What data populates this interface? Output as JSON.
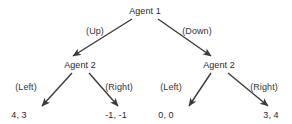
{
  "diagram": {
    "type": "extensive-form-game-tree",
    "background_color": "#ffffff",
    "line_color": "#3a3a3a",
    "text_color": "#2b2b2b",
    "nodes": [
      {
        "id": "root",
        "label": "Agent 1",
        "x": 145,
        "y": 11
      },
      {
        "id": "left-node",
        "label": "Agent 2",
        "x": 80,
        "y": 66
      },
      {
        "id": "right-node",
        "label": "Agent 2",
        "x": 219,
        "y": 66
      }
    ],
    "edges": [
      {
        "id": "root-up",
        "label": "(Up)",
        "from": "root",
        "to": "left-node",
        "label_x": 95,
        "label_y": 31
      },
      {
        "id": "root-down",
        "label": "(Down)",
        "from": "root",
        "to": "right-node",
        "label_x": 197,
        "label_y": 31
      },
      {
        "id": "left-left",
        "label": "(Left)",
        "from": "left-node",
        "to": "payoff-1",
        "label_x": 26,
        "label_y": 87
      },
      {
        "id": "left-right",
        "label": "(Right)",
        "from": "left-node",
        "to": "payoff-2",
        "label_x": 119,
        "label_y": 87
      },
      {
        "id": "right-left",
        "label": "(Left)",
        "from": "right-node",
        "to": "payoff-3",
        "label_x": 171,
        "label_y": 87
      },
      {
        "id": "right-right",
        "label": "(Right)",
        "from": "right-node",
        "to": "payoff-4",
        "label_x": 264,
        "label_y": 87
      }
    ],
    "payoffs": [
      {
        "id": "payoff-1",
        "label": "4, 3",
        "x": 19,
        "y": 113
      },
      {
        "id": "payoff-2",
        "label": "-1, -1",
        "x": 116,
        "y": 113
      },
      {
        "id": "payoff-3",
        "label": "0, 0",
        "x": 166,
        "y": 113
      },
      {
        "id": "payoff-4",
        "label": "3, 4",
        "x": 271,
        "y": 113
      }
    ]
  }
}
